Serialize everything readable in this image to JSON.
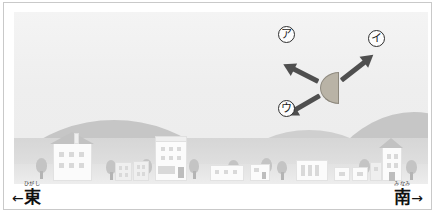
{
  "figure": {
    "type": "illustration-diagram"
  },
  "moon": {
    "name": "half-moon",
    "phase_label": "半月",
    "fill_color": "#b9b3a6",
    "outline_color": "#8e897e",
    "flat_edge": "right"
  },
  "arrows": [
    {
      "id": "a",
      "label": "ア",
      "direction": "upper-left",
      "angle_deg": 207,
      "color": "#4f4f4f"
    },
    {
      "id": "i",
      "label": "イ",
      "direction": "upper-right",
      "angle_deg": -38,
      "color": "#4f4f4f"
    },
    {
      "id": "u",
      "label": "ウ",
      "direction": "lower-left",
      "angle_deg": 150,
      "color": "#4f4f4f"
    }
  ],
  "compass": {
    "east": {
      "kanji": "東",
      "ruby": "ひがし",
      "arrow": "←"
    },
    "south": {
      "kanji": "南",
      "ruby": "みなみ",
      "arrow": "→"
    }
  },
  "scene": {
    "sky_color": "#f1f1f1",
    "hill_color": "#c6c6c6",
    "ground_color": "#dcdcdc",
    "building_color": "#fbfbfb",
    "tree_color": "#c4c4c4"
  },
  "colors": {
    "border": "#c9c9c9",
    "text": "#1c1c1c"
  }
}
